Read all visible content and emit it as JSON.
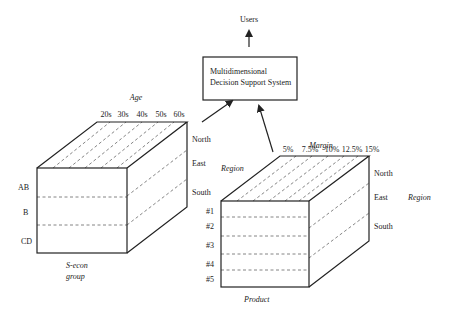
{
  "users_label": "Users",
  "system_box": {
    "line1": "Multidimensional",
    "line2": "Decision Support System"
  },
  "left_cube": {
    "top_axis_title": "Age",
    "top_ticks": [
      "20s",
      "30s",
      "40s",
      "50s",
      "60s"
    ],
    "side_ticks": [
      "North",
      "East",
      "South"
    ],
    "front_ticks": [
      "AB",
      "B",
      "CD"
    ],
    "bottom_title_line1": "S-econ",
    "bottom_title_line2": "group"
  },
  "right_cube": {
    "top_axis_title": "Margin",
    "top_ticks": [
      "5%",
      "7.5%",
      "10%",
      "12.5%",
      "15%"
    ],
    "left_title": "Region",
    "side_ticks": [
      "North",
      "East",
      "South"
    ],
    "side_title": "Region",
    "front_ticks": [
      "#1",
      "#2",
      "#3",
      "#4",
      "#5"
    ],
    "bottom_title": "Product"
  }
}
